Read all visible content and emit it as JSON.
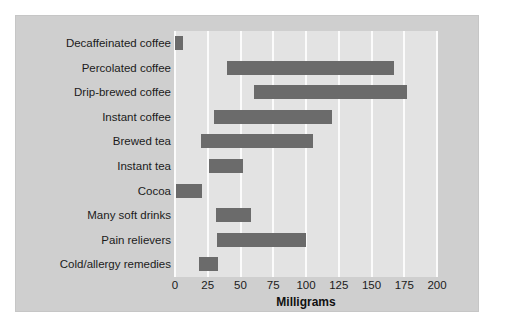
{
  "chart_data": {
    "type": "bar",
    "orientation": "horizontal",
    "title": "",
    "xlabel": "Milligrams",
    "ylabel": "",
    "xlim": [
      0,
      200
    ],
    "xticks": [
      0,
      25,
      50,
      75,
      100,
      125,
      150,
      175,
      200
    ],
    "grid": true,
    "legend": false,
    "bar_style": "range",
    "categories": [
      "Decaffeinated coffee",
      "Percolated coffee",
      "Drip-brewed coffee",
      "Instant coffee",
      "Brewed tea",
      "Instant tea",
      "Cocoa",
      "Many soft drinks",
      "Pain relievers",
      "Cold/allergy remedies"
    ],
    "ranges": [
      {
        "category": "Decaffeinated coffee",
        "low": 0,
        "high": 6
      },
      {
        "category": "Percolated coffee",
        "low": 40,
        "high": 167
      },
      {
        "category": "Drip-brewed coffee",
        "low": 60,
        "high": 177
      },
      {
        "category": "Instant coffee",
        "low": 30,
        "high": 120
      },
      {
        "category": "Brewed tea",
        "low": 20,
        "high": 105
      },
      {
        "category": "Instant tea",
        "low": 26,
        "high": 52
      },
      {
        "category": "Cocoa",
        "low": 1,
        "high": 21
      },
      {
        "category": "Many soft drinks",
        "low": 31,
        "high": 58
      },
      {
        "category": "Pain relievers",
        "low": 32,
        "high": 100
      },
      {
        "category": "Cold/allergy remedies",
        "low": 18,
        "high": 33
      }
    ],
    "colors": {
      "bar": "#6b6b6b",
      "plot_background": "#e3e3e3",
      "panel_background": "#cfcfcf",
      "gridline": "#fbfbfb",
      "text": "#1b1b1b"
    }
  }
}
